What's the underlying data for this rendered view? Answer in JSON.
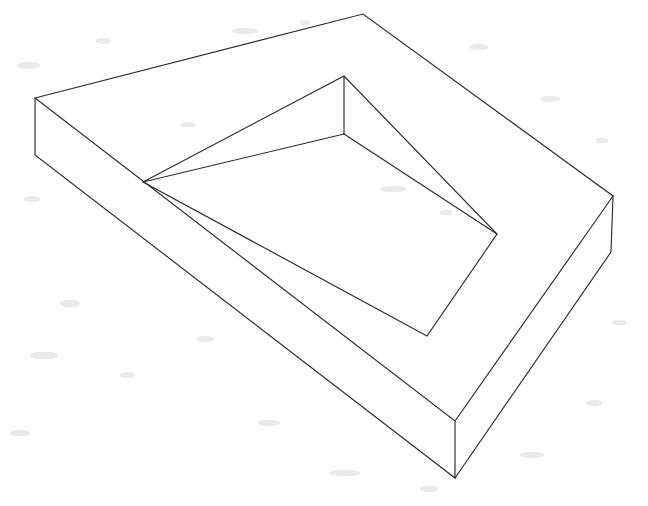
{
  "document": {
    "title": "Isometric Open Tray Wireframe",
    "background_color": "#ffffff",
    "stroke_color": "#2b2b2b",
    "stroke_width": 1.15,
    "width": 648,
    "height": 506,
    "description": "Monochrome line drawing of an open rectangular tray (shallow box with a rectangular cavity) seen in oblique/isometric projection.",
    "fill_color": "#ffffff"
  },
  "figure": {
    "name": "open-rectangular-tray",
    "projection": "oblique-isometric",
    "line_style": "solid",
    "shading": "none",
    "vertices": {
      "outer_top_left": [
        35,
        98
      ],
      "outer_top_apex": [
        363,
        14
      ],
      "outer_top_right": [
        613,
        196
      ],
      "outer_top_near": [
        455,
        421
      ],
      "outer_bottom_left": [
        35,
        155
      ],
      "outer_bottom_right": [
        611,
        252
      ],
      "outer_bottom_near": [
        455,
        478
      ],
      "inner_top_left": [
        143,
        182
      ],
      "inner_top_apex": [
        344,
        76
      ],
      "inner_top_right": [
        497,
        234
      ],
      "inner_top_near": [
        427,
        336
      ],
      "inner_floor_left": [
        143,
        182
      ],
      "inner_floor_apex": [
        344,
        134
      ],
      "inner_floor_right": [
        497,
        234
      ],
      "inner_floor_near": [
        427,
        336
      ]
    },
    "edges": [
      {
        "name": "outer-rim-left-to-apex",
        "from": "outer_top_left",
        "to": "outer_top_apex"
      },
      {
        "name": "outer-rim-apex-to-right",
        "from": "outer_top_apex",
        "to": "outer_top_right"
      },
      {
        "name": "outer-rim-right-to-near",
        "from": "outer_top_right",
        "to": "outer_top_near"
      },
      {
        "name": "outer-rim-near-to-left",
        "from": "outer_top_near",
        "to": "outer_top_left"
      },
      {
        "name": "vertical-edge-left",
        "from": "outer_top_left",
        "to": "outer_bottom_left"
      },
      {
        "name": "vertical-edge-right",
        "from": "outer_top_right",
        "to": "outer_bottom_right"
      },
      {
        "name": "vertical-edge-near",
        "from": "outer_top_near",
        "to": "outer_bottom_near"
      },
      {
        "name": "outer-base-left-to-near",
        "from": "outer_bottom_left",
        "to": "outer_bottom_near"
      },
      {
        "name": "outer-base-near-to-right",
        "from": "outer_bottom_near",
        "to": "outer_bottom_right"
      },
      {
        "name": "inner-rim-left-to-apex",
        "from": "inner_top_left",
        "to": "inner_top_apex"
      },
      {
        "name": "inner-rim-apex-to-right",
        "from": "inner_top_apex",
        "to": "inner_top_right"
      },
      {
        "name": "inner-rim-right-to-near",
        "from": "inner_top_right",
        "to": "inner_top_near"
      },
      {
        "name": "inner-rim-near-to-left",
        "from": "inner_top_near",
        "to": "inner_top_left"
      },
      {
        "name": "cavity-vertical-edge-apex",
        "from": "inner_top_apex",
        "to": "inner_floor_apex"
      },
      {
        "name": "cavity-floor-left-to-apex",
        "from": "inner_floor_left",
        "to": "inner_floor_apex"
      },
      {
        "name": "cavity-floor-apex-to-right",
        "from": "inner_floor_apex",
        "to": "inner_floor_right"
      }
    ],
    "faces": [
      {
        "name": "rim-top-face",
        "type": "annulus-rectangle"
      },
      {
        "name": "outer-wall-front-left",
        "type": "quad"
      },
      {
        "name": "outer-wall-front-right",
        "type": "quad"
      },
      {
        "name": "cavity-wall-back-left",
        "type": "quad"
      },
      {
        "name": "cavity-wall-back-right",
        "type": "quad"
      },
      {
        "name": "cavity-floor",
        "type": "quad"
      }
    ]
  },
  "paths": {
    "outer_top_rim": "M 35 98 L 363 14 L 613 196 L 455 421 Z",
    "inner_top_rim": "M 143 182 L 344 76 L 497 234 L 427 336 Z",
    "outer_wall_front": "M 35 98 L 35 155 L 455 478 L 455 421 Z",
    "outer_wall_right": "M 455 421 L 455 478 L 611 252 L 613 196 Z",
    "cavity_wall_left": "M 143 182 L 344 76 L 344 134 Z",
    "cavity_wall_right": "M 344 76 L 497 234 L 344 134 Z",
    "cavity_floor": "M 143 182 L 344 134 L 497 234 L 427 336 Z"
  },
  "grain": {
    "enabled": true,
    "color": "#d9d9d9",
    "note": "faint scanner speckle artifacts on paper"
  }
}
